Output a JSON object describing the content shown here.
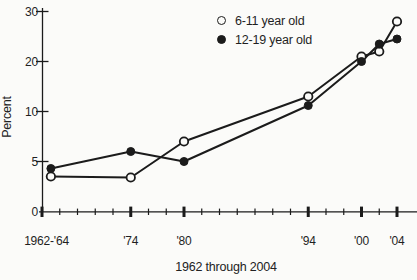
{
  "chart_data": {
    "type": "line",
    "title": "",
    "xlabel": "1962 through 2004",
    "ylabel": "Percent",
    "ylim": [
      0,
      30
    ],
    "y_ticks": [
      0,
      5,
      10,
      20,
      30
    ],
    "y_scale_note": "segmented axis: labeled ticks 0, 5, 10, 20, 30 are drawn equally spaced",
    "grid": false,
    "legend_position": "top-right-inside",
    "x_axis": {
      "start_year": 1964,
      "end_year": 2004,
      "tick_step_years": 2,
      "bold_tick_years": [
        1964,
        1974,
        1980,
        1994,
        2000,
        2004
      ],
      "tick_labels": [
        {
          "year": 1964,
          "label": "1962-'64"
        },
        {
          "year": 1974,
          "label": "'74"
        },
        {
          "year": 1980,
          "label": "'80"
        },
        {
          "year": 1994,
          "label": "'94"
        },
        {
          "year": 2000,
          "label": "'00"
        },
        {
          "year": 2004,
          "label": "'04"
        }
      ]
    },
    "series": [
      {
        "name": "6-11 year old",
        "marker": "open-circle",
        "x": [
          1965,
          1974,
          1980,
          1994,
          2000,
          2002,
          2004
        ],
        "values": [
          3.5,
          3.4,
          7.0,
          13.0,
          21.0,
          22.0,
          28.0
        ]
      },
      {
        "name": "12-19 year old",
        "marker": "filled-circle",
        "x": [
          1965,
          1974,
          1980,
          1994,
          2000,
          2002,
          2004
        ],
        "values": [
          4.3,
          6.0,
          5.0,
          11.2,
          20.0,
          23.5,
          24.5
        ]
      }
    ]
  },
  "colors": {
    "ink": "#1b1b1b",
    "background": "#fbfbf9"
  }
}
